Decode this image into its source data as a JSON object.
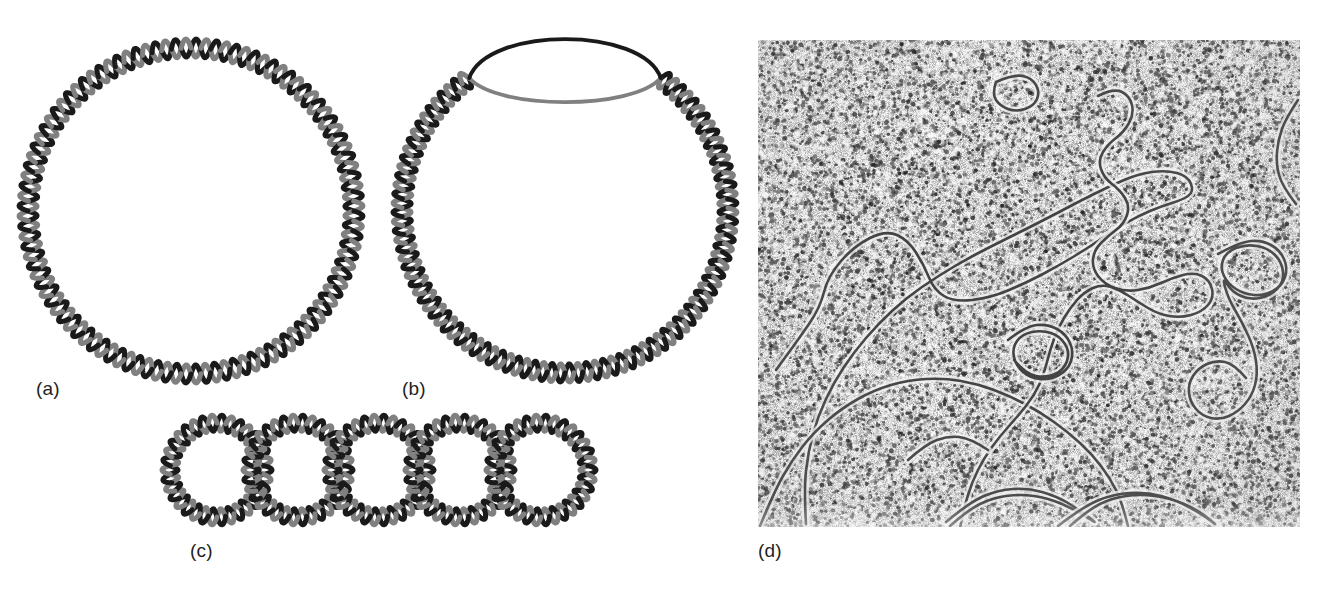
{
  "figure": {
    "background_color": "#ffffff",
    "width": 1322,
    "height": 589
  },
  "colors": {
    "strand_dark": "#1a1a1a",
    "strand_gray": "#808080",
    "label_text": "#231f20",
    "micrograph_background": "#c9c9c9",
    "micrograph_filament": "#3a3a3a",
    "micrograph_halo": "#eeeeee"
  },
  "panels": [
    {
      "id": "a",
      "label": "(a)",
      "caption_text": "(a)",
      "kind": "diagram",
      "description": "closed circular double-stranded DNA",
      "geometry": {
        "shape": "circle",
        "center_x": 181,
        "center_y": 181,
        "radius": 163,
        "helix_turns": 52,
        "helix_amplitude": 9,
        "strand_width": 5
      }
    },
    {
      "id": "b",
      "label": "(b)",
      "caption_text": "(b)",
      "kind": "diagram",
      "description": "circular DNA with a denaturation bubble where the two strands separate",
      "geometry": {
        "shape": "circle-with-bubble",
        "center_x": 180,
        "center_y": 192,
        "radius": 163,
        "helix_turns": 46,
        "helix_amplitude": 9,
        "strand_width": 5,
        "bubble_start_angle_deg": -126,
        "bubble_end_angle_deg": -54,
        "bubble_rise": 56,
        "bubble_drop": 18
      }
    },
    {
      "id": "c",
      "label": "(c)",
      "caption_text": "(c)",
      "kind": "diagram",
      "description": "catenane: five interlocked circular DNA duplexes in a chain",
      "geometry": {
        "shape": "catenane-chain",
        "circle_count": 5,
        "circle_radius": 47,
        "circle_spacing": 81,
        "first_center_x": 52,
        "center_y": 55,
        "helix_turns": 17,
        "helix_amplitude": 8,
        "strand_width": 5
      }
    },
    {
      "id": "d",
      "label": "(d)",
      "caption_text": "(d)",
      "kind": "electron-micrograph",
      "description": "electron micrograph of DNA molecules showing open circles, loops and supercoiled crossovers on a grainy stained background",
      "geometry": {
        "left": 758,
        "top": 40,
        "width": 542,
        "height": 487,
        "grain_density": "high"
      }
    }
  ]
}
